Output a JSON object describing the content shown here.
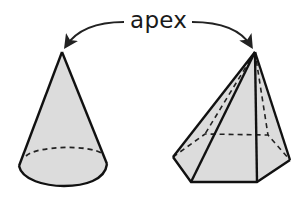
{
  "diagram": {
    "label": "apex",
    "shapes": [
      {
        "name": "cone",
        "apex": [
          62,
          52
        ]
      },
      {
        "name": "pentagonal-pyramid",
        "apex": [
          255,
          52
        ]
      }
    ]
  },
  "colors": {
    "stroke": "#111111",
    "fill": "#dcdcdc",
    "arrow": "#222222"
  }
}
